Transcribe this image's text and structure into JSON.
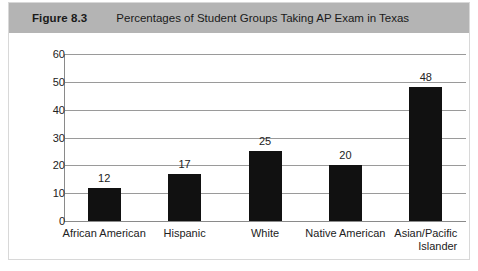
{
  "figure": {
    "number_label": "Figure 8.3",
    "caption": "Percentages of Student Groups Taking AP Exam in Texas"
  },
  "colors": {
    "header_band": "#b4b4b4",
    "bar_fill": "#111111",
    "gridline": "#9a9a9a",
    "border": "#d8d8d8",
    "text": "#222222"
  },
  "chart_data": {
    "type": "bar",
    "title": "Percentages of Student Groups Taking AP Exam in Texas",
    "xlabel": "",
    "ylabel": "",
    "ylim": [
      0,
      60
    ],
    "yticks": [
      0,
      10,
      20,
      30,
      40,
      50,
      60
    ],
    "ytick_labels": [
      "0",
      "10",
      "20",
      "30",
      "40",
      "50",
      "60"
    ],
    "grid": true,
    "legend": false,
    "categories": [
      "African American",
      "Hispanic",
      "White",
      "Native American",
      "Asian/Pacific Islander"
    ],
    "category_lines": [
      [
        "African American"
      ],
      [
        "Hispanic"
      ],
      [
        "White"
      ],
      [
        "Native American"
      ],
      [
        "Asian/Pacific",
        "Islander"
      ]
    ],
    "values": [
      12,
      17,
      25,
      20,
      48
    ],
    "value_labels": [
      "12",
      "17",
      "25",
      "20",
      "48"
    ]
  }
}
